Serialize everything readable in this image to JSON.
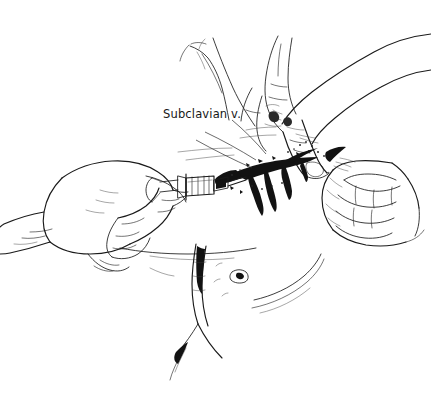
{
  "figure": {
    "background_color": "#ffffff",
    "ink_color": "#1a1a1a",
    "width": 431,
    "height": 394,
    "style": "pen-and-ink line drawing"
  },
  "annotations": [
    {
      "id": "subclavian-vein",
      "text": "Subclavian v.",
      "x": 163,
      "y": 109,
      "leader": "line from label down-right to vessel"
    }
  ],
  "elements": {
    "operator_left_hand": "hand gripping syringe barrel, lower left",
    "operator_right_hand": "hand with index finger palpating, upper right",
    "assistant_hand": "clenched fist retracting tissue, right",
    "syringe": "syringe with needle entering vessel",
    "subclavian_vein": "dark shaded vein beneath clavicle",
    "chest_wall": "patient chest with sternum and breast contour"
  }
}
